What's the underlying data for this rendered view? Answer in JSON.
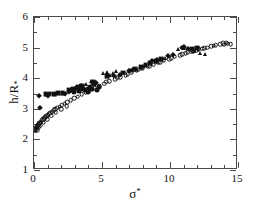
{
  "figure": {
    "background_color": "#ffffff",
    "frame_color": "#4a4a4a",
    "marker_color": "#111111"
  },
  "chart_data": {
    "type": "scatter",
    "title": "",
    "xlabel": "σ*",
    "ylabel": "h/R*",
    "xlim": [
      0,
      15
    ],
    "ylim": [
      1,
      6
    ],
    "xticks": [
      0,
      5,
      10,
      15
    ],
    "yticks": [
      1,
      2,
      3,
      4,
      5,
      6
    ],
    "xtick_labels": [
      "0",
      "5",
      "10",
      "15"
    ],
    "ytick_labels": [
      "1",
      "2",
      "3",
      "4",
      "5",
      "6"
    ],
    "x_minor_interval": 1,
    "y_minor_interval": 0.5,
    "grid": false,
    "legend": "none",
    "tick_direction": "in",
    "frame": "box",
    "series": [
      {
        "name": "open-circles",
        "marker": "circle-open",
        "size": 4.6,
        "points": [
          [
            0.05,
            2.3
          ],
          [
            0.1,
            2.33
          ],
          [
            0.15,
            2.36
          ],
          [
            0.2,
            2.4
          ],
          [
            0.25,
            2.43
          ],
          [
            0.3,
            2.46
          ],
          [
            0.35,
            2.49
          ],
          [
            0.4,
            2.52
          ],
          [
            0.45,
            2.55
          ],
          [
            0.5,
            2.58
          ],
          [
            0.58,
            2.62
          ],
          [
            0.66,
            2.66
          ],
          [
            0.74,
            2.7
          ],
          [
            0.82,
            2.73
          ],
          [
            0.9,
            2.76
          ],
          [
            1.0,
            2.8
          ],
          [
            1.1,
            2.84
          ],
          [
            1.2,
            2.87
          ],
          [
            1.32,
            2.91
          ],
          [
            1.45,
            2.95
          ],
          [
            1.58,
            2.99
          ],
          [
            1.72,
            3.03
          ],
          [
            1.88,
            3.07
          ],
          [
            2.05,
            3.12
          ],
          [
            2.25,
            3.17
          ],
          [
            2.45,
            3.22
          ],
          [
            2.7,
            3.28
          ],
          [
            2.95,
            3.34
          ],
          [
            3.2,
            3.4
          ],
          [
            3.5,
            3.47
          ],
          [
            3.8,
            3.54
          ],
          [
            4.1,
            3.6
          ],
          [
            4.45,
            3.67
          ],
          [
            4.8,
            3.74
          ],
          [
            5.15,
            3.82
          ],
          [
            5.55,
            3.9
          ],
          [
            5.95,
            3.97
          ],
          [
            6.35,
            4.04
          ],
          [
            6.75,
            4.1
          ],
          [
            7.15,
            4.18
          ],
          [
            7.55,
            4.25
          ],
          [
            7.95,
            4.32
          ],
          [
            8.35,
            4.38
          ],
          [
            8.75,
            4.44
          ],
          [
            9.15,
            4.52
          ],
          [
            9.55,
            4.58
          ],
          [
            9.95,
            4.63
          ],
          [
            10.35,
            4.7
          ],
          [
            10.75,
            4.76
          ],
          [
            11.15,
            4.82
          ],
          [
            11.55,
            4.86
          ],
          [
            11.95,
            4.92
          ],
          [
            12.35,
            4.97
          ],
          [
            12.75,
            5.0
          ],
          [
            13.05,
            5.05
          ],
          [
            13.35,
            5.08
          ],
          [
            13.7,
            5.12
          ],
          [
            14.0,
            5.1
          ],
          [
            14.25,
            5.13
          ],
          [
            14.45,
            5.11
          ],
          [
            0.12,
            2.28
          ],
          [
            0.22,
            2.31
          ],
          [
            0.35,
            2.38
          ],
          [
            0.5,
            2.45
          ],
          [
            0.7,
            2.55
          ],
          [
            0.95,
            2.66
          ],
          [
            1.25,
            2.78
          ],
          [
            1.6,
            2.88
          ],
          [
            2.0,
            2.99
          ],
          [
            2.4,
            3.08
          ],
          [
            5.3,
            3.88
          ],
          [
            6.1,
            4.02
          ],
          [
            6.9,
            4.14
          ],
          [
            7.7,
            4.28
          ],
          [
            8.5,
            4.4
          ],
          [
            9.3,
            4.53
          ],
          [
            10.1,
            4.66
          ],
          [
            10.9,
            4.78
          ],
          [
            11.7,
            4.88
          ],
          [
            12.5,
            4.98
          ],
          [
            13.2,
            5.06
          ],
          [
            13.9,
            5.14
          ],
          [
            14.15,
            5.16
          ],
          [
            12.1,
            4.94
          ],
          [
            11.3,
            4.84
          ]
        ]
      },
      {
        "name": "filled-diamonds",
        "marker": "diamond-fill",
        "size": 4.4,
        "points": [
          [
            0.35,
            3.42
          ],
          [
            0.45,
            3.02
          ],
          [
            0.95,
            3.44
          ],
          [
            1.05,
            3.43
          ],
          [
            2.25,
            3.5
          ],
          [
            2.55,
            3.56
          ],
          [
            3.05,
            3.66
          ],
          [
            3.4,
            3.72
          ],
          [
            6.95,
            4.22
          ],
          [
            7.3,
            4.28
          ],
          [
            8.7,
            4.56
          ],
          [
            9.05,
            4.6
          ],
          [
            9.85,
            4.72
          ],
          [
            10.2,
            4.76
          ],
          [
            10.85,
            5.0
          ],
          [
            11.05,
            5.02
          ],
          [
            11.35,
            4.96
          ],
          [
            5.85,
            4.06
          ],
          [
            6.3,
            4.12
          ],
          [
            4.55,
            3.85
          ]
        ]
      },
      {
        "name": "filled-squares",
        "marker": "square-fill",
        "size": 4.8,
        "points": [
          [
            0.85,
            3.48
          ],
          [
            1.15,
            3.5
          ],
          [
            1.45,
            3.47
          ],
          [
            1.75,
            3.52
          ],
          [
            2.1,
            3.52
          ],
          [
            2.6,
            3.6
          ],
          [
            2.9,
            3.64
          ],
          [
            3.25,
            3.7
          ],
          [
            3.55,
            3.76
          ],
          [
            6.55,
            4.18
          ],
          [
            7.1,
            4.25
          ],
          [
            7.45,
            4.3
          ],
          [
            7.85,
            4.36
          ],
          [
            8.2,
            4.42
          ],
          [
            8.55,
            4.5
          ],
          [
            8.95,
            4.56
          ],
          [
            9.35,
            4.62
          ],
          [
            11.6,
            4.94
          ],
          [
            12.0,
            4.98
          ],
          [
            4.35,
            3.86
          ],
          [
            5.4,
            4.08
          ]
        ]
      },
      {
        "name": "filled-circles",
        "marker": "circle-fill",
        "size": 5.0,
        "points": [
          [
            2.8,
            3.62
          ],
          [
            3.15,
            3.68
          ],
          [
            3.45,
            3.74
          ],
          [
            3.6,
            3.66
          ],
          [
            3.75,
            3.6
          ],
          [
            3.95,
            3.64
          ],
          [
            4.15,
            3.72
          ],
          [
            4.4,
            3.8
          ],
          [
            4.6,
            3.62
          ],
          [
            4.75,
            3.7
          ],
          [
            2.95,
            3.56
          ],
          [
            3.3,
            3.58
          ],
          [
            4.0,
            3.56
          ],
          [
            4.25,
            3.64
          ]
        ]
      },
      {
        "name": "filled-triangles",
        "marker": "triangle-fill",
        "size": 5.2,
        "points": [
          [
            3.85,
            3.82
          ],
          [
            4.2,
            3.9
          ],
          [
            5.05,
            4.16
          ],
          [
            5.35,
            4.2
          ],
          [
            5.6,
            4.12
          ],
          [
            5.8,
            4.18
          ],
          [
            6.05,
            4.22
          ],
          [
            6.45,
            4.16
          ],
          [
            10.6,
            4.94
          ],
          [
            11.0,
            4.98
          ],
          [
            11.8,
            4.88
          ],
          [
            12.2,
            4.82
          ],
          [
            12.55,
            4.78
          ],
          [
            9.6,
            4.66
          ],
          [
            8.05,
            4.4
          ]
        ]
      }
    ]
  }
}
